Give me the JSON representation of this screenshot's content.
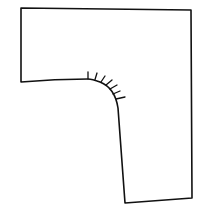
{
  "diagram": {
    "stroke_color": "#111111",
    "background_color": "#ffffff",
    "outline_path": "M21,8 L191,10 L192,198 L125,203 L118,108 Q115,88 100,82 Q92,79 88,79 Q55,79 21,82 Z",
    "hatch_ticks": [
      {
        "x1": 88,
        "y1": 79,
        "x2": 88,
        "y2": 72
      },
      {
        "x1": 95,
        "y1": 79.5,
        "x2": 97,
        "y2": 73
      },
      {
        "x1": 101,
        "y1": 82,
        "x2": 105,
        "y2": 76
      },
      {
        "x1": 106,
        "y1": 85,
        "x2": 112,
        "y2": 80
      },
      {
        "x1": 110,
        "y1": 89,
        "x2": 117,
        "y2": 85
      },
      {
        "x1": 113,
        "y1": 94,
        "x2": 120,
        "y2": 91
      },
      {
        "x1": 116,
        "y1": 99,
        "x2": 125,
        "y2": 97
      }
    ]
  }
}
